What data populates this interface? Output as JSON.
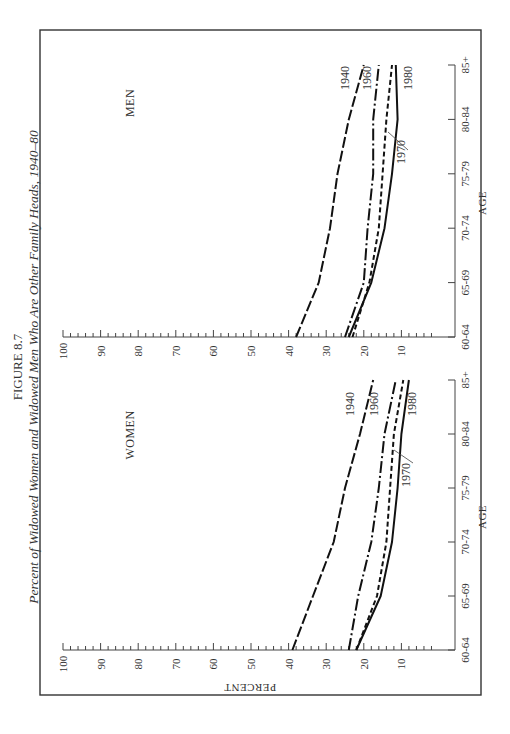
{
  "figure": {
    "number": "FIGURE 8.7",
    "title": "Percent of Widowed Women and Widowed Men Who Are Other Family Heads, 1940–80",
    "orientation": "rotated 90° counter-clockwise on page"
  },
  "axes": {
    "y_label": "PERCENT",
    "x_label": "AGE",
    "y_ticks": [
      "100",
      "90",
      "80",
      "70",
      "60",
      "50",
      "40",
      "30",
      "20",
      "10"
    ],
    "x_ticks": [
      "60-64",
      "65-69",
      "70-74",
      "75-79",
      "80-84",
      "85+"
    ]
  },
  "panels": [
    {
      "id": "women",
      "label": "WOMEN"
    },
    {
      "id": "men",
      "label": "MEN"
    }
  ],
  "series_styles": {
    "1940": "long-dash",
    "1960": "dash-dot",
    "1970": "short-dash",
    "1980": "solid"
  },
  "chart_data": [
    {
      "type": "line",
      "title": "WOMEN",
      "xlabel": "AGE",
      "ylabel": "PERCENT",
      "ylim": [
        0,
        100
      ],
      "grid": false,
      "categories": [
        "60-64",
        "65-69",
        "70-74",
        "75-79",
        "80-84",
        "85+"
      ],
      "series": [
        {
          "name": "1940",
          "values": [
            39,
            33.5,
            28,
            25,
            21,
            17.5
          ]
        },
        {
          "name": "1960",
          "values": [
            24,
            21.5,
            18,
            16,
            14.5,
            11.5
          ]
        },
        {
          "name": "1970",
          "values": [
            22,
            16.5,
            14,
            13,
            12,
            9.5
          ]
        },
        {
          "name": "1980",
          "values": [
            22,
            15.5,
            12.5,
            11,
            10,
            8
          ]
        }
      ]
    },
    {
      "type": "line",
      "title": "MEN",
      "xlabel": "AGE",
      "ylabel": "PERCENT",
      "ylim": [
        0,
        100
      ],
      "grid": false,
      "categories": [
        "60-64",
        "65-69",
        "70-74",
        "75-79",
        "80-84",
        "85+"
      ],
      "series": [
        {
          "name": "1940",
          "values": [
            38,
            32,
            29,
            27,
            24,
            20
          ]
        },
        {
          "name": "1960",
          "values": [
            25,
            20,
            19,
            17.5,
            17.5,
            16
          ]
        },
        {
          "name": "1970",
          "values": [
            23,
            18.5,
            16,
            15,
            14,
            12.5
          ]
        },
        {
          "name": "1980",
          "values": [
            24,
            18,
            14.5,
            12.5,
            11,
            11.5
          ]
        }
      ]
    }
  ]
}
